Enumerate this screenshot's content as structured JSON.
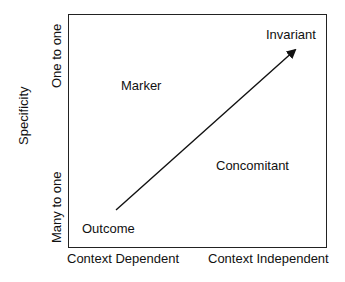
{
  "diagram": {
    "y_axis": {
      "title": "Specificity",
      "top_label": "One to one",
      "bottom_label": "Many to one"
    },
    "x_axis": {
      "left_label": "Context Dependent",
      "right_label": "Context Independent"
    },
    "quadrants": {
      "top_left": "Marker",
      "top_right": "Invariant",
      "bottom_left": "Outcome",
      "bottom_right": "Concomitant"
    },
    "arrow": {
      "from": "Outcome",
      "to": "Invariant",
      "color": "#111111"
    }
  }
}
